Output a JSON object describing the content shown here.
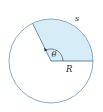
{
  "diagram": {
    "type": "circle-sector",
    "labels": {
      "arc": "s",
      "angle": "θ",
      "radius": "R"
    },
    "colors": {
      "circle_stroke": "#7aa3c4",
      "sector_fill": "#d6ecf6",
      "radius_stroke": "#5b86ad",
      "text": "#2a2a2a"
    },
    "geometry": {
      "center": [
        51,
        61
      ],
      "radius": 42,
      "sector_start_deg": 0,
      "sector_end_deg": 116
    }
  }
}
